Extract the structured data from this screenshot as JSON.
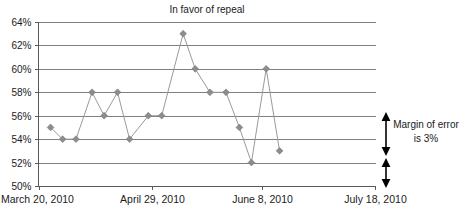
{
  "chart_data": {
    "type": "line",
    "title": "In favor of repeal",
    "xlabel": "",
    "ylabel": "",
    "ylim": [
      50,
      64
    ],
    "ytick_values": [
      64,
      62,
      60,
      58,
      56,
      54,
      52,
      50
    ],
    "ytick_labels": [
      "64%",
      "62%",
      "60%",
      "58%",
      "56%",
      "54%",
      "52%",
      "50%"
    ],
    "xtick_labels": [
      "March 20, 2010",
      "April 29, 2010",
      "June 8, 2010",
      "July 18, 2010"
    ],
    "xtick_positions": [
      0,
      4.2,
      8.4,
      12.6
    ],
    "grid": true,
    "legend": "none",
    "x": [
      0.45,
      0.9,
      1.4,
      2.0,
      2.45,
      2.95,
      3.4,
      4.1,
      4.6,
      5.4,
      5.85,
      6.4,
      7.0,
      7.5,
      7.95,
      8.5,
      9.0
    ],
    "values": [
      55,
      54,
      54,
      58,
      56,
      58,
      54,
      56,
      56,
      63,
      60,
      58,
      58,
      55,
      52,
      60,
      53
    ],
    "point_labels": [
      "55%",
      "54%",
      "54%",
      "58%",
      "56%",
      "58%",
      "54%",
      "56%",
      "56%",
      "63%",
      "60%",
      "58%",
      "58%",
      "55%",
      "52%",
      "60%",
      "53%"
    ],
    "series_name": "In favor of repeal",
    "annotations": [
      {
        "name": "margin-of-error",
        "line1": "Margin of error",
        "line2": "is 3%",
        "span_percent": 3,
        "arrows": 2
      }
    ],
    "colors": {
      "marker": "#8c8c8c",
      "line": "#9a9a9a",
      "grid": "#808080",
      "axis": "#595959",
      "text": "#1a1a1a",
      "arrow": "#000000",
      "background": "#ffffff"
    }
  },
  "annotation": {
    "margin_line1": "Margin of error",
    "margin_line2": "is 3%"
  },
  "axis": {
    "y_labels": [
      "64%",
      "62%",
      "60%",
      "58%",
      "56%",
      "54%",
      "52%",
      "50%"
    ],
    "x_labels": [
      "March 20, 2010",
      "April 29, 2010",
      "June 8, 2010",
      "July 18, 2010"
    ]
  },
  "title": {
    "text": "In favor of repeal"
  }
}
